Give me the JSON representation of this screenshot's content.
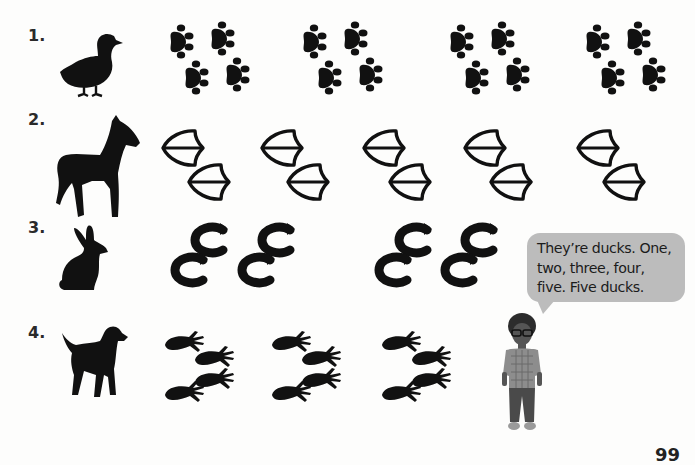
{
  "exercise": {
    "rows": [
      {
        "number": "1.",
        "animal": "duck",
        "track_type": "paw-prints",
        "group_count": 4
      },
      {
        "number": "2.",
        "animal": "horse",
        "track_type": "bird-prints",
        "group_count": 5
      },
      {
        "number": "3.",
        "animal": "rabbit",
        "track_type": "hoof-prints",
        "group_count": 4
      },
      {
        "number": "4.",
        "animal": "dog",
        "track_type": "hand-prints",
        "group_count": 3
      }
    ]
  },
  "speech_bubble": {
    "line1": "They’re ducks. One,",
    "line2": "two, three, four,",
    "line3": "five. Five ducks."
  },
  "character": {
    "name": "boy"
  },
  "page_number": "99",
  "colors": {
    "ink": "#111111",
    "bubble": "#bcbcbc",
    "background": "#fdfdfc"
  }
}
